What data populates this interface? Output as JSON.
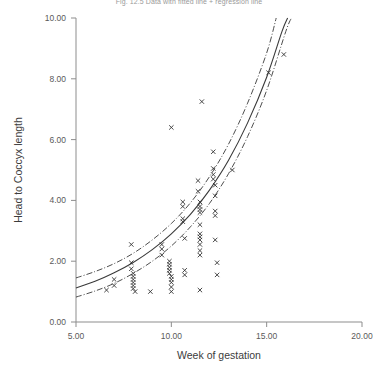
{
  "chart_data": {
    "type": "scatter",
    "title": "Fig. 12.5  Data with fitted line + regression line",
    "xlabel": "Week of gestation",
    "ylabel": "Head to Coccyx length",
    "xlim": [
      5.0,
      20.0
    ],
    "ylim": [
      0.0,
      10.0
    ],
    "xticks": [
      5.0,
      10.0,
      15.0,
      20.0
    ],
    "xtick_labels": [
      "5.00",
      "10.00",
      "15.00",
      "20.00"
    ],
    "yticks": [
      0.0,
      2.0,
      4.0,
      6.0,
      8.0,
      10.0
    ],
    "ytick_labels": [
      "0.00",
      "2.00",
      "4.00",
      "6.00",
      "8.00",
      "10.00"
    ],
    "grid": false,
    "legend": null,
    "marker": "x",
    "marker_color": "#333333",
    "line_color": "#3a3a3a",
    "series": [
      {
        "name": "Observations",
        "type": "scatter",
        "points": [
          [
            6.6,
            1.05
          ],
          [
            7.0,
            1.4
          ],
          [
            7.0,
            1.2
          ],
          [
            7.9,
            2.55
          ],
          [
            7.9,
            1.95
          ],
          [
            7.9,
            1.75
          ],
          [
            8.0,
            1.6
          ],
          [
            8.0,
            1.5
          ],
          [
            8.0,
            1.4
          ],
          [
            8.0,
            1.3
          ],
          [
            8.0,
            1.2
          ],
          [
            8.0,
            1.1
          ],
          [
            8.1,
            1.0
          ],
          [
            8.9,
            1.0
          ],
          [
            9.5,
            2.55
          ],
          [
            9.5,
            2.4
          ],
          [
            9.5,
            2.2
          ],
          [
            9.9,
            2.0
          ],
          [
            9.9,
            1.9
          ],
          [
            9.9,
            1.8
          ],
          [
            9.9,
            1.7
          ],
          [
            9.9,
            1.6
          ],
          [
            10.0,
            1.5
          ],
          [
            10.0,
            1.4
          ],
          [
            10.0,
            1.3
          ],
          [
            10.0,
            1.15
          ],
          [
            10.0,
            1.0
          ],
          [
            10.0,
            6.4
          ],
          [
            10.6,
            3.95
          ],
          [
            10.6,
            3.8
          ],
          [
            10.6,
            3.4
          ],
          [
            10.6,
            3.3
          ],
          [
            10.7,
            2.75
          ],
          [
            10.7,
            1.7
          ],
          [
            10.7,
            1.55
          ],
          [
            11.4,
            4.65
          ],
          [
            11.4,
            4.3
          ],
          [
            11.5,
            3.95
          ],
          [
            11.5,
            3.8
          ],
          [
            11.5,
            3.7
          ],
          [
            11.5,
            3.6
          ],
          [
            11.5,
            3.2
          ],
          [
            11.5,
            2.9
          ],
          [
            11.5,
            2.8
          ],
          [
            11.5,
            2.7
          ],
          [
            11.5,
            2.55
          ],
          [
            11.5,
            2.35
          ],
          [
            11.5,
            2.2
          ],
          [
            11.5,
            1.05
          ],
          [
            11.6,
            7.25
          ],
          [
            12.2,
            5.6
          ],
          [
            12.2,
            5.05
          ],
          [
            12.2,
            4.85
          ],
          [
            12.2,
            4.7
          ],
          [
            12.3,
            4.5
          ],
          [
            12.3,
            4.15
          ],
          [
            12.3,
            3.65
          ],
          [
            12.3,
            3.5
          ],
          [
            12.3,
            2.7
          ],
          [
            12.4,
            1.95
          ],
          [
            12.4,
            1.55
          ],
          [
            13.2,
            5.0
          ],
          [
            15.1,
            8.2
          ],
          [
            15.9,
            8.8
          ]
        ]
      },
      {
        "name": "Fitted regression line",
        "type": "line",
        "style": "solid",
        "points": [
          [
            5.0,
            1.12
          ],
          [
            6.0,
            1.34
          ],
          [
            7.0,
            1.62
          ],
          [
            8.0,
            1.96
          ],
          [
            9.0,
            2.38
          ],
          [
            10.0,
            2.9
          ],
          [
            11.0,
            3.54
          ],
          [
            12.0,
            4.34
          ],
          [
            13.0,
            5.32
          ],
          [
            14.0,
            6.55
          ],
          [
            15.0,
            8.05
          ],
          [
            15.8,
            9.55
          ],
          [
            16.1,
            10.0
          ]
        ]
      },
      {
        "name": "Upper confidence band",
        "type": "line",
        "style": "dash-dot",
        "points": [
          [
            5.0,
            1.45
          ],
          [
            6.0,
            1.66
          ],
          [
            7.0,
            1.92
          ],
          [
            8.0,
            2.26
          ],
          [
            9.0,
            2.7
          ],
          [
            10.0,
            3.24
          ],
          [
            11.0,
            3.92
          ],
          [
            12.0,
            4.78
          ],
          [
            13.0,
            5.85
          ],
          [
            14.0,
            7.2
          ],
          [
            15.0,
            8.85
          ],
          [
            15.5,
            10.0
          ]
        ]
      },
      {
        "name": "Lower confidence band",
        "type": "line",
        "style": "dash-dot",
        "points": [
          [
            5.0,
            0.82
          ],
          [
            6.0,
            1.02
          ],
          [
            7.0,
            1.27
          ],
          [
            8.0,
            1.6
          ],
          [
            9.0,
            2.0
          ],
          [
            10.0,
            2.5
          ],
          [
            11.0,
            3.13
          ],
          [
            12.0,
            3.9
          ],
          [
            13.0,
            4.88
          ],
          [
            14.0,
            6.1
          ],
          [
            15.0,
            7.62
          ],
          [
            16.0,
            9.55
          ],
          [
            16.3,
            10.0
          ]
        ]
      }
    ]
  }
}
